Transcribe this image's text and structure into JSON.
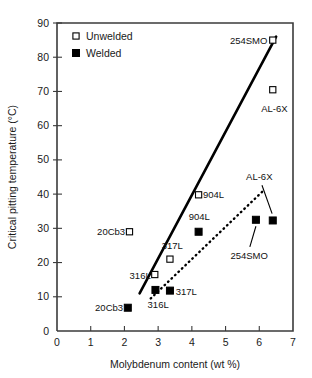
{
  "chart_data": {
    "type": "scatter",
    "title": "",
    "xlabel": "Molybdenum content (wt %)",
    "ylabel": "Critical pitting temperature (°C)",
    "xlim": [
      0,
      7
    ],
    "ylim": [
      0,
      90
    ],
    "xticks": [
      0,
      1,
      2,
      3,
      4,
      5,
      6,
      7
    ],
    "yticks": [
      0,
      10,
      20,
      30,
      40,
      50,
      60,
      70,
      80,
      90
    ],
    "xtick_labels": [
      "0",
      "1",
      "2",
      "3",
      "4",
      "5",
      "6",
      "7"
    ],
    "ytick_labels": [
      "0",
      "10",
      "20",
      "30",
      "40",
      "50",
      "60",
      "70",
      "80",
      "90"
    ],
    "grid": false,
    "legend_position": "top-left",
    "legend": [
      {
        "name": "Unwelded",
        "marker": "open-square"
      },
      {
        "name": "Welded",
        "marker": "filled-square"
      }
    ],
    "series": [
      {
        "name": "Unwelded",
        "marker": "open-square",
        "points": [
          {
            "label": "20Cb3",
            "x": 2.15,
            "y": 29.0
          },
          {
            "label": "316L",
            "x": 2.9,
            "y": 16.5
          },
          {
            "label": "317L",
            "x": 3.35,
            "y": 21.0
          },
          {
            "label": "904L",
            "x": 4.2,
            "y": 39.8
          },
          {
            "label": "AL-6X",
            "x": 6.4,
            "y": 70.5
          },
          {
            "label": "254SMO",
            "x": 6.4,
            "y": 85.0
          }
        ]
      },
      {
        "name": "Welded",
        "marker": "filled-square",
        "points": [
          {
            "label": "20Cb3",
            "x": 2.1,
            "y": 6.8
          },
          {
            "label": "316L",
            "x": 2.92,
            "y": 12.0
          },
          {
            "label": "317L",
            "x": 3.35,
            "y": 11.8
          },
          {
            "label": "904L",
            "x": 4.2,
            "y": 29.0
          },
          {
            "label": "254SMO",
            "x": 5.9,
            "y": 32.5
          },
          {
            "label": "AL-6X",
            "x": 6.4,
            "y": 32.3
          }
        ]
      }
    ],
    "trend_lines": [
      {
        "name": "unwelded-trend",
        "style": "solid",
        "x1": 2.45,
        "y1": 11.0,
        "x2": 6.5,
        "y2": 86.0
      },
      {
        "name": "welded-trend",
        "style": "dotted",
        "x1": 2.78,
        "y1": 9.5,
        "x2": 6.12,
        "y2": 41.0
      }
    ],
    "annotations": [
      {
        "text": "20Cb3",
        "anchor": "end",
        "x": 2.02,
        "y": 29.0,
        "for": "unwelded-20cb3"
      },
      {
        "text": "316L",
        "anchor": "end",
        "x": 2.78,
        "y": 16.3,
        "for": "unwelded-316l"
      },
      {
        "text": "317L",
        "anchor": "middle",
        "x": 3.42,
        "y": 25.0,
        "for": "unwelded-317l"
      },
      {
        "text": "904L",
        "anchor": "start",
        "x": 4.33,
        "y": 39.8,
        "for": "unwelded-904l"
      },
      {
        "text": "254SMO",
        "anchor": "end",
        "x": 6.24,
        "y": 85.0,
        "for": "unwelded-254smo"
      },
      {
        "text": "AL-6X",
        "anchor": "middle",
        "x": 6.45,
        "y": 65.0,
        "for": "unwelded-al6x"
      },
      {
        "text": "20Cb3",
        "anchor": "end",
        "x": 1.96,
        "y": 6.8,
        "for": "welded-20cb3"
      },
      {
        "text": "316L",
        "anchor": "middle",
        "x": 3.0,
        "y": 7.6,
        "for": "welded-316l"
      },
      {
        "text": "317L",
        "anchor": "start",
        "x": 3.52,
        "y": 11.6,
        "for": "welded-317l"
      },
      {
        "text": "904L",
        "anchor": "middle",
        "x": 4.22,
        "y": 33.5,
        "for": "welded-904l"
      },
      {
        "text": "254SMO",
        "anchor": "middle",
        "x": 5.7,
        "y": 22.0,
        "for": "welded-254smo"
      },
      {
        "text": "AL-6X",
        "anchor": "middle",
        "x": 6.0,
        "y": 45.0,
        "for": "welded-al6x"
      }
    ],
    "leader_lines": [
      {
        "name": "leader-254smo-welded",
        "x1": 5.72,
        "y1": 24.6,
        "x2": 5.9,
        "y2": 30.6
      },
      {
        "name": "leader-al6x-welded",
        "x1": 6.08,
        "y1": 42.6,
        "x2": 6.38,
        "y2": 34.3
      }
    ]
  }
}
